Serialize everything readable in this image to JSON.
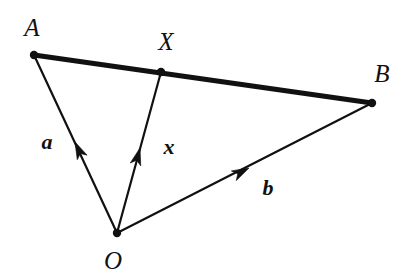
{
  "figure": {
    "background_color": "#ffffff",
    "ink_color": "#111111",
    "width": 413,
    "height": 280
  },
  "points": [
    {
      "id": "A",
      "label": "A",
      "x": 34,
      "y": 55,
      "label_x": 32,
      "label_y": 27,
      "dot_radius": 4.2
    },
    {
      "id": "X",
      "label": "X",
      "x": 161,
      "y": 72,
      "label_x": 166,
      "label_y": 41,
      "dot_radius": 4.2
    },
    {
      "id": "B",
      "label": "B",
      "x": 372,
      "y": 103,
      "label_x": 382,
      "label_y": 73,
      "dot_radius": 4.2
    },
    {
      "id": "O",
      "label": "O",
      "x": 117,
      "y": 233,
      "label_x": 113,
      "label_y": 260,
      "dot_radius": 4.2
    }
  ],
  "segments": [
    {
      "id": "AB",
      "from": "A",
      "to": "B",
      "x1": 34,
      "y1": 55,
      "x2": 372,
      "y2": 103,
      "stroke_width": 5.0,
      "style": "thick",
      "arrow": false
    }
  ],
  "vectors": [
    {
      "id": "a",
      "label": "a",
      "from": "O",
      "to": "A",
      "x1": 117,
      "y1": 233,
      "x2": 34,
      "y2": 55,
      "stroke_width": 2.2,
      "arrow_x": 75,
      "arrow_y": 142,
      "label_x": 47,
      "label_y": 142
    },
    {
      "id": "x",
      "label": "x",
      "from": "O",
      "to": "X",
      "x1": 117,
      "y1": 233,
      "x2": 161,
      "y2": 72,
      "stroke_width": 2.2,
      "arrow_x": 140,
      "arrow_y": 148,
      "label_x": 169,
      "label_y": 147
    },
    {
      "id": "b",
      "label": "b",
      "from": "O",
      "to": "B",
      "x1": 117,
      "y1": 233,
      "x2": 372,
      "y2": 103,
      "stroke_width": 2.2,
      "arrow_x": 249,
      "arrow_y": 168,
      "label_x": 268,
      "label_y": 188
    }
  ]
}
